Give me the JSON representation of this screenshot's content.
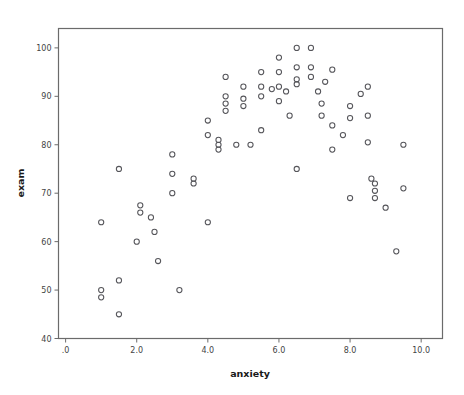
{
  "chart_data": {
    "type": "scatter",
    "title": "",
    "xlabel": "anxiety",
    "ylabel": "exam",
    "xlim": [
      -0.2,
      10.6
    ],
    "ylim": [
      40,
      104
    ],
    "grid": false,
    "legend": null,
    "marker": "open-circle",
    "marker_color": "#55555a",
    "x_ticks": [
      0,
      2,
      4,
      6,
      8,
      10
    ],
    "x_tick_labels": [
      ".0",
      "2.0",
      "4.0",
      "6.0",
      "8.0",
      "10.0"
    ],
    "y_ticks": [
      40,
      50,
      60,
      70,
      80,
      90,
      100
    ],
    "y_tick_labels": [
      "40",
      "50",
      "60",
      "70",
      "80",
      "90",
      "100"
    ],
    "points": [
      [
        1.0,
        50.0
      ],
      [
        1.0,
        48.5
      ],
      [
        1.0,
        64.0
      ],
      [
        1.5,
        75.0
      ],
      [
        1.5,
        52.0
      ],
      [
        1.5,
        45.0
      ],
      [
        2.0,
        60.0
      ],
      [
        2.1,
        67.5
      ],
      [
        2.1,
        66.0
      ],
      [
        2.4,
        65.0
      ],
      [
        2.5,
        62.0
      ],
      [
        2.6,
        56.0
      ],
      [
        3.0,
        78.0
      ],
      [
        3.0,
        74.0
      ],
      [
        3.0,
        70.0
      ],
      [
        3.2,
        50.0
      ],
      [
        3.6,
        73.0
      ],
      [
        3.6,
        72.0
      ],
      [
        4.0,
        85.0
      ],
      [
        4.0,
        82.0
      ],
      [
        4.0,
        64.0
      ],
      [
        4.3,
        81.0
      ],
      [
        4.3,
        80.0
      ],
      [
        4.3,
        79.0
      ],
      [
        4.5,
        90.0
      ],
      [
        4.5,
        88.5
      ],
      [
        4.5,
        87.0
      ],
      [
        4.5,
        94.0
      ],
      [
        4.8,
        80.0
      ],
      [
        5.0,
        92.0
      ],
      [
        5.0,
        89.5
      ],
      [
        5.0,
        88.0
      ],
      [
        5.2,
        80.0
      ],
      [
        5.5,
        95.0
      ],
      [
        5.5,
        92.0
      ],
      [
        5.5,
        90.0
      ],
      [
        5.5,
        83.0
      ],
      [
        5.8,
        91.5
      ],
      [
        6.0,
        98.0
      ],
      [
        6.0,
        95.0
      ],
      [
        6.0,
        92.0
      ],
      [
        6.0,
        89.0
      ],
      [
        6.2,
        91.0
      ],
      [
        6.3,
        86.0
      ],
      [
        6.5,
        100.0
      ],
      [
        6.5,
        96.0
      ],
      [
        6.5,
        93.5
      ],
      [
        6.5,
        92.5
      ],
      [
        6.5,
        75.0
      ],
      [
        6.9,
        100.0
      ],
      [
        6.9,
        96.0
      ],
      [
        6.9,
        94.0
      ],
      [
        7.1,
        91.0
      ],
      [
        7.2,
        88.5
      ],
      [
        7.2,
        86.0
      ],
      [
        7.3,
        93.0
      ],
      [
        7.5,
        95.5
      ],
      [
        7.5,
        84.0
      ],
      [
        7.5,
        79.0
      ],
      [
        7.8,
        82.0
      ],
      [
        8.0,
        88.0
      ],
      [
        8.0,
        85.5
      ],
      [
        8.0,
        69.0
      ],
      [
        8.3,
        90.5
      ],
      [
        8.5,
        92.0
      ],
      [
        8.5,
        86.0
      ],
      [
        8.5,
        80.5
      ],
      [
        8.6,
        73.0
      ],
      [
        8.7,
        72.0
      ],
      [
        8.7,
        70.5
      ],
      [
        8.7,
        69.0
      ],
      [
        9.0,
        67.0
      ],
      [
        9.3,
        58.0
      ],
      [
        9.5,
        80.0
      ],
      [
        9.5,
        71.0
      ]
    ]
  },
  "axes": {
    "x_title": "anxiety",
    "y_title": "exam"
  }
}
